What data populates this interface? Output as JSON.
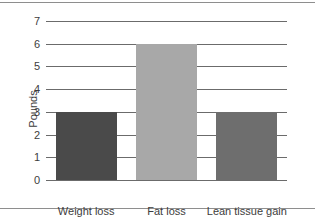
{
  "chart_data": {
    "type": "bar",
    "title": "",
    "xlabel": "",
    "ylabel": "Pounds",
    "categories": [
      "Weight loss",
      "Fat loss",
      "Lean tissue gain"
    ],
    "values": [
      3,
      6,
      3
    ],
    "bar_colors": [
      "#4a4a4a",
      "#a8a8a8",
      "#6e6e6e"
    ],
    "ylim": [
      0,
      7
    ],
    "yticks": [
      0,
      1,
      2,
      3,
      4,
      5,
      6,
      7
    ],
    "ytick_labels": [
      "0",
      "1",
      "2",
      "3",
      "4",
      "5",
      "6",
      "7"
    ],
    "grid": "horizontal",
    "legend": "none",
    "gridline_color": "#6b6b6b",
    "text_color": "#3d3d3d",
    "background_color": "#ffffff",
    "frame_rule_color": "#8e8e8e"
  }
}
